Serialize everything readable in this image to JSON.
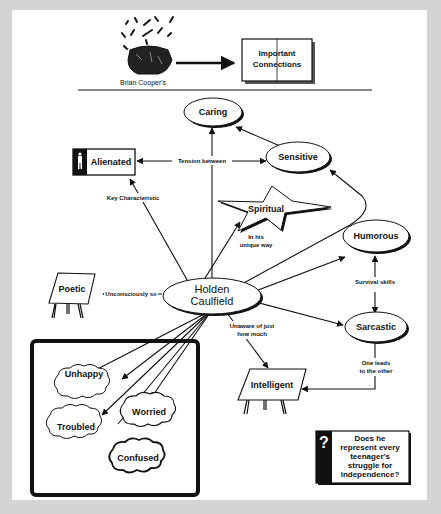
{
  "header": {
    "author_label": "Brian Cooper's",
    "book_line1": "Important",
    "book_line2": "Connections"
  },
  "center": {
    "line1": "Holden",
    "line2": "Caulfield"
  },
  "nodes": {
    "caring": "Caring",
    "sensitive": "Sensitive",
    "alienated": "Alienated",
    "spiritual": "Spiritual",
    "humorous": "Humorous",
    "sarcastic": "Sarcastic",
    "poetic": "Poetic",
    "intelligent": "Intelligent",
    "unhappy": "Unhappy",
    "troubled": "Troubled",
    "worried": "Worried",
    "confused": "Confused"
  },
  "edges": {
    "tension_between": "Tension between",
    "key_characteristic": "Key Characteristic",
    "in_his_1": "In his",
    "in_his_2": "unique way",
    "unconsciously_so": "Unconsciously so",
    "survival_skills": "Survival skills",
    "unaware_1": "Unaware of just",
    "unaware_2": "how much",
    "one_leads_1": "One leads",
    "one_leads_2": "to the other"
  },
  "question": {
    "icon": "?",
    "line1": "Does he",
    "line2": "represent every",
    "line3": "teenager's",
    "line4": "struggle for",
    "line5": "independence?"
  },
  "colors": {
    "background": "#d4d4d4",
    "panel": "#ffffff",
    "ink": "#111111"
  }
}
